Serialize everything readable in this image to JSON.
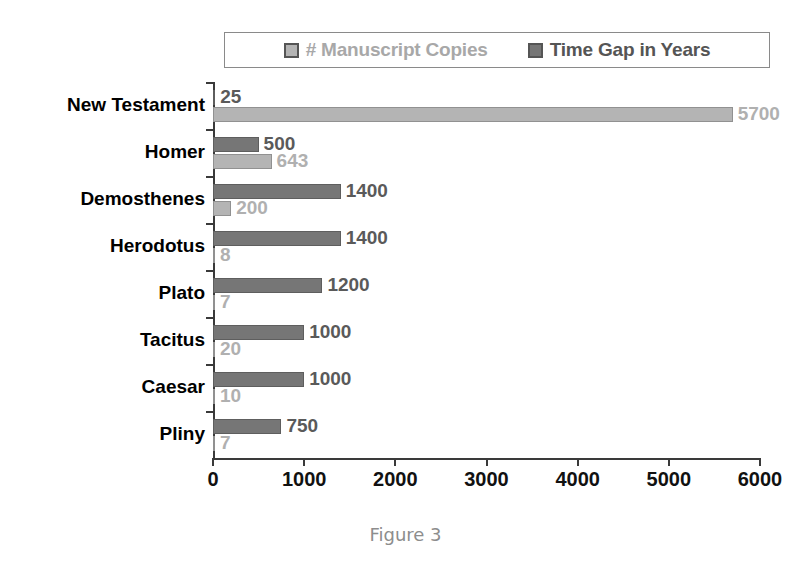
{
  "caption": "Figure 3",
  "legend": {
    "position": "top-center",
    "entries": [
      {
        "label": "# Manuscript Copies",
        "color": "#b4b4b4",
        "series_key": "copies"
      },
      {
        "label": "Time Gap in Years",
        "color": "#767676",
        "series_key": "gap"
      }
    ]
  },
  "axis": {
    "xticks": [
      0,
      1000,
      2000,
      3000,
      4000,
      5000,
      6000
    ],
    "xtick_labels": [
      "0",
      "1000",
      "2000",
      "3000",
      "4000",
      "5000",
      "6000"
    ],
    "xmin": 0,
    "xmax": 6000
  },
  "colors": {
    "copies_fill": "#b4b4b4",
    "copies_label": "#b0b0b0",
    "gap_fill": "#767676",
    "gap_label": "#5a5a5a",
    "axis": "#3a3a3a",
    "caption": "#8d8d8d",
    "background": "#ffffff"
  },
  "chart_data": {
    "type": "bar",
    "orientation": "horizontal",
    "title": "",
    "xlabel": "",
    "ylabel": "",
    "xlim": [
      0,
      6000
    ],
    "grid": false,
    "legend_position": "top-center",
    "categories": [
      "New Testament",
      "Homer",
      "Demosthenes",
      "Herodotus",
      "Plato",
      "Tacitus",
      "Caesar",
      "Pliny"
    ],
    "series": [
      {
        "name": "Time Gap in Years",
        "key": "gap",
        "color": "#767676",
        "values": [
          25,
          500,
          1400,
          1400,
          1200,
          1000,
          1000,
          750
        ],
        "labels": [
          "25",
          "500",
          "1400",
          "1400",
          "1200",
          "1000",
          "1000",
          "750"
        ]
      },
      {
        "name": "# Manuscript Copies",
        "key": "copies",
        "color": "#b4b4b4",
        "values": [
          5700,
          643,
          200,
          8,
          7,
          20,
          10,
          7
        ],
        "labels": [
          "5700",
          "643",
          "200",
          "8",
          "7",
          "20",
          "10",
          "7"
        ]
      }
    ]
  }
}
